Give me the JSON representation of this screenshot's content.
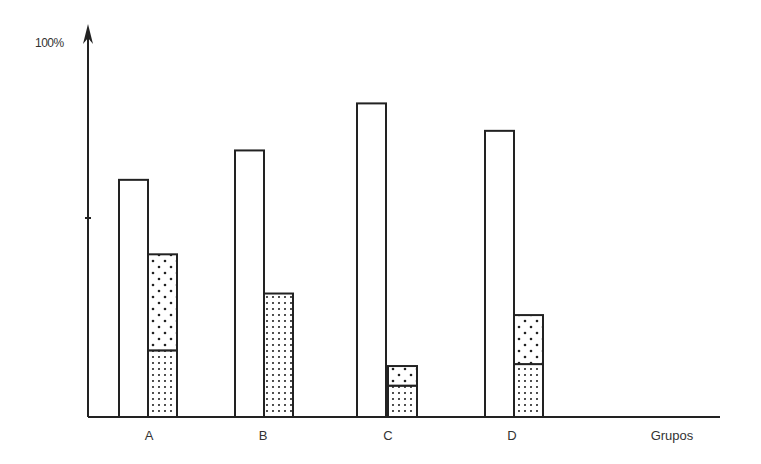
{
  "chart_data": {
    "type": "bar",
    "title": "",
    "xlabel": "Grupos",
    "ylabel": "100%",
    "ylim": [
      0,
      100
    ],
    "yticks": [
      50,
      100
    ],
    "grid": false,
    "legend": null,
    "categories": [
      "A",
      "B",
      "C",
      "D"
    ],
    "series": [
      {
        "name": "total (empty bar)",
        "pattern": "none",
        "values": [
          60.5,
          68,
          80,
          73
        ]
      },
      {
        "name": "dense dots (lower segment)",
        "pattern": "dense-dots",
        "stack": "s2",
        "values": [
          17,
          31.5,
          8,
          13.5
        ]
      },
      {
        "name": "sparse dots (upper segment)",
        "pattern": "sparse-dots",
        "stack": "s2",
        "values": [
          24.5,
          0,
          5,
          12.5
        ]
      }
    ]
  },
  "labels": {
    "y_axis_top": "100%",
    "x_axis_title": "Grupos",
    "categories": [
      "A",
      "B",
      "C",
      "D"
    ]
  }
}
